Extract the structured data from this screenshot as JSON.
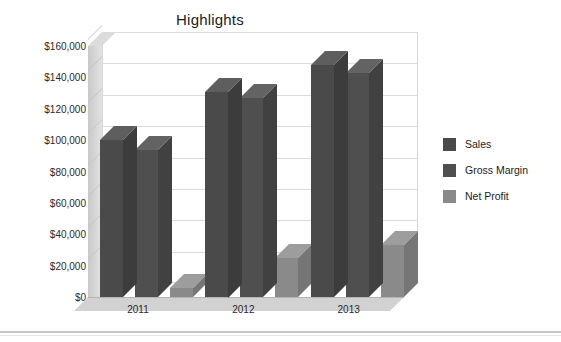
{
  "chart_data": {
    "type": "bar",
    "title": "Highlights",
    "xlabel": "",
    "ylabel": "",
    "categories": [
      "2011",
      "2012",
      "2013"
    ],
    "series": [
      {
        "name": "Sales",
        "values": [
          100000,
          131000,
          148000
        ],
        "color": "#4a4a4a"
      },
      {
        "name": "Gross Margin",
        "values": [
          94000,
          127000,
          143000
        ],
        "color": "#4f4f4f"
      },
      {
        "name": "Net Profit",
        "values": [
          6000,
          25000,
          33000
        ],
        "color": "#8a8a8a"
      }
    ],
    "ylim": [
      0,
      160000
    ],
    "ytick_values": [
      0,
      20000,
      40000,
      60000,
      80000,
      100000,
      120000,
      140000,
      160000
    ],
    "ytick_labels": [
      "$0",
      "$20,000",
      "$40,000",
      "$60,000",
      "$80,000",
      "$100,000",
      "$120,000",
      "$140,000",
      "$160,000"
    ],
    "grid": true,
    "legend_position": "right",
    "three_d": true
  },
  "legend": {
    "items": [
      {
        "label": "Sales",
        "swatch": "#4a4a4a"
      },
      {
        "label": "Gross Margin",
        "swatch": "#4f4f4f"
      },
      {
        "label": "Net Profit",
        "swatch": "#8a8a8a"
      }
    ]
  }
}
